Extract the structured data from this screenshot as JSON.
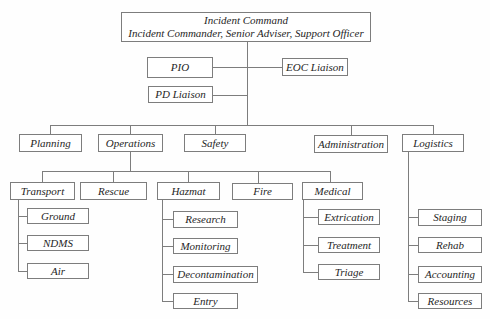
{
  "org": {
    "root": {
      "title": "Incident Command",
      "subtitle": "Incident Commander, Senior Adviser, Support Officer"
    },
    "staff": [
      "PIO",
      "EOC Liaison",
      "PD Liaison"
    ],
    "sections": [
      "Planning",
      "Operations",
      "Safety",
      "Administration",
      "Logistics"
    ],
    "operations_branches": [
      "Transport",
      "Rescue",
      "Hazmat",
      "Fire",
      "Medical"
    ],
    "units": {
      "transport": [
        "Ground",
        "NDMS",
        "Air"
      ],
      "hazmat": [
        "Research",
        "Monitoring",
        "Decontamination",
        "Entry"
      ],
      "medical": [
        "Extrication",
        "Treatment",
        "Triage"
      ],
      "logistics": [
        "Staging",
        "Rehab",
        "Accounting",
        "Resources"
      ]
    }
  },
  "colors": {
    "line": "#7d7d7d",
    "box_border": "#7d7d7d",
    "text": "#262626",
    "background": "#fefefe"
  }
}
